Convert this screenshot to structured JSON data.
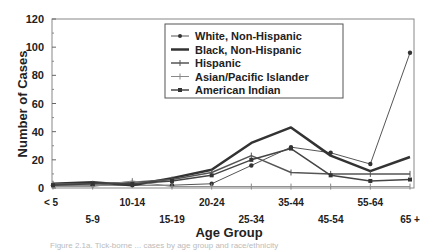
{
  "chart_data": {
    "type": "line",
    "title": "",
    "xlabel": "Age Group",
    "ylabel": "Number of Cases",
    "ylim": [
      0,
      120
    ],
    "yticks": [
      0,
      20,
      40,
      60,
      80,
      100,
      120
    ],
    "categories": [
      "< 5",
      "5-9",
      "10-14",
      "15-19",
      "20-24",
      "25-34",
      "35-44",
      "45-54",
      "55-64",
      "65 +"
    ],
    "grid": false,
    "legend_position": "upper-center-inside",
    "series": [
      {
        "name": "White, Non-Hispanic",
        "values": [
          2,
          2,
          2,
          2,
          3,
          16,
          29,
          25,
          17,
          96
        ],
        "color": "#555555",
        "width": 1,
        "marker": "dot"
      },
      {
        "name": "Black, Non-Hispanic",
        "values": [
          3,
          4,
          2,
          7,
          13,
          32,
          43,
          23,
          12,
          22
        ],
        "color": "#333333",
        "width": 2.5,
        "marker": "none"
      },
      {
        "name": "Hispanic",
        "values": [
          3,
          3,
          4,
          6,
          11,
          23,
          11,
          10,
          10,
          10
        ],
        "color": "#555555",
        "width": 1.5,
        "marker": "tick"
      },
      {
        "name": "Asian/Pacific Islander",
        "values": [
          1,
          1,
          5,
          1,
          1,
          1,
          1,
          1,
          1,
          1
        ],
        "color": "#888888",
        "width": 1,
        "marker": "tick"
      },
      {
        "name": "American Indian",
        "values": [
          2,
          3,
          3,
          5,
          9,
          20,
          28,
          9,
          5,
          6
        ],
        "color": "#444444",
        "width": 1.5,
        "marker": "square"
      }
    ]
  },
  "caption": "Figure 2.1a. Tick-borne ... cases by age group and race/ethnicity"
}
